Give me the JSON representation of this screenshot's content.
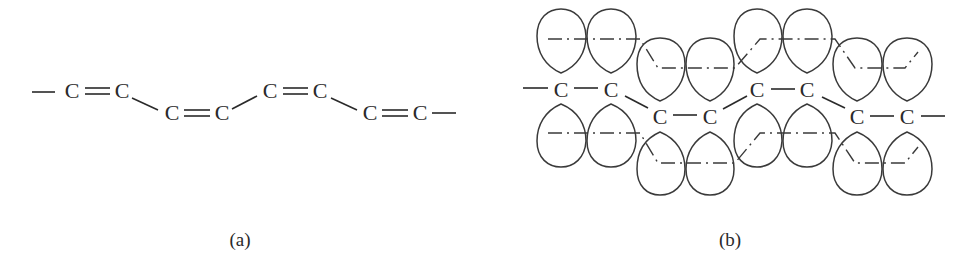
{
  "figure": {
    "panels": [
      {
        "id": "a",
        "caption": "(a)",
        "description": "Polyene chain with alternating double bonds (zigzag)",
        "atom_label": "C",
        "atoms": [
          {
            "x": 72,
            "y": 90
          },
          {
            "x": 122,
            "y": 90
          },
          {
            "x": 172,
            "y": 112
          },
          {
            "x": 222,
            "y": 112
          },
          {
            "x": 270,
            "y": 90
          },
          {
            "x": 320,
            "y": 90
          },
          {
            "x": 370,
            "y": 112
          },
          {
            "x": 420,
            "y": 112
          }
        ],
        "bonds": [
          {
            "from": "start",
            "to": 0,
            "order": 1
          },
          {
            "from": 0,
            "to": 1,
            "order": 2
          },
          {
            "from": 1,
            "to": 2,
            "order": 1
          },
          {
            "from": 2,
            "to": 3,
            "order": 2
          },
          {
            "from": 3,
            "to": 4,
            "order": 1
          },
          {
            "from": 4,
            "to": 5,
            "order": 2
          },
          {
            "from": 5,
            "to": 6,
            "order": 1
          },
          {
            "from": 6,
            "to": 7,
            "order": 2
          },
          {
            "from": 7,
            "to": "end",
            "order": 1
          }
        ]
      },
      {
        "id": "b",
        "caption": "(b)",
        "description": "Sigma-bonded carbon skeleton with overlapping p-orbital lobes above and below",
        "atom_label": "C",
        "atoms": [
          {
            "x": 561,
            "y": 90
          },
          {
            "x": 611,
            "y": 90
          },
          {
            "x": 660,
            "y": 116
          },
          {
            "x": 710,
            "y": 116
          },
          {
            "x": 757,
            "y": 90
          },
          {
            "x": 807,
            "y": 90
          },
          {
            "x": 857,
            "y": 116
          },
          {
            "x": 907,
            "y": 116
          }
        ],
        "orbital_lobe_pairs": 8,
        "lobes_per_pair": 2
      }
    ],
    "colors": {
      "ink": "#2a2a2a",
      "background": "#ffffff"
    }
  }
}
